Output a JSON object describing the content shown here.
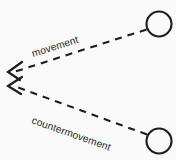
{
  "figure": {
    "kind": "diagram",
    "background_color": "#fafafa",
    "stroke_color": "#1c1c1c",
    "text_color": "#1f1f1f",
    "width": 176,
    "height": 160
  },
  "nodes": [
    {
      "id": "node-top-right",
      "name": "upper-circle-node",
      "shape": "circle",
      "cx": 159,
      "cy": 24,
      "r": 12.5,
      "label": ""
    },
    {
      "id": "node-bottom-right",
      "name": "lower-circle-node",
      "shape": "circle",
      "cx": 159,
      "cy": 141,
      "r": 12.5,
      "label": ""
    }
  ],
  "edges": [
    {
      "id": "edge-movement",
      "label": "movement",
      "style": "dashed",
      "dash_pattern": "7 6",
      "from": "node-top-right",
      "to": "arrowhead-upper",
      "x1": 146.5,
      "y1": 29.5,
      "x2": 14,
      "y2": 72,
      "arrow_at": "end",
      "label_x": 33,
      "label_y": 57,
      "label_rotation": -17.5
    },
    {
      "id": "edge-countermovement",
      "label": "countermovement",
      "style": "dashed",
      "dash_pattern": "7 6",
      "from": "node-bottom-right",
      "to": "arrowhead-lower",
      "x1": 147,
      "y1": 134.5,
      "x2": 14,
      "y2": 86,
      "arrow_at": "end",
      "label_x": 31,
      "label_y": 123,
      "label_rotation": 19.5
    }
  ],
  "arrowheads": [
    {
      "id": "arrowhead-upper",
      "name": "arrowhead-movement",
      "tip_x": 8,
      "tip_y": 72,
      "points": "22,62 8,72 20,80"
    },
    {
      "id": "arrowhead-lower",
      "name": "arrowhead-countermovement",
      "tip_x": 8,
      "tip_y": 86,
      "points": "22,77 8,86 21,94"
    }
  ]
}
